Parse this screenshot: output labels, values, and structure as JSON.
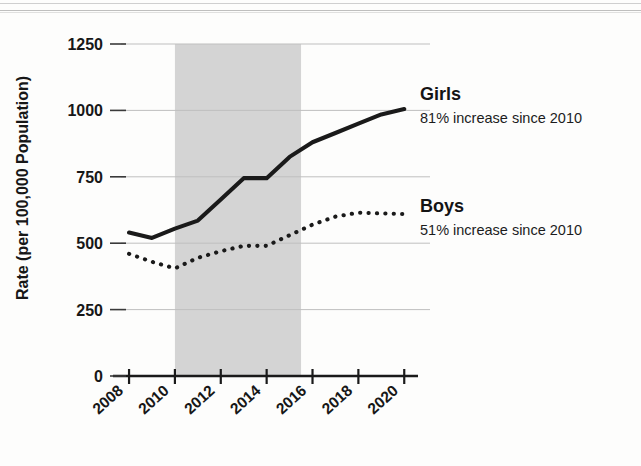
{
  "figure": {
    "background_color": "#fdfdfc",
    "scan_artifact": "horizontal-scan-lines-top"
  },
  "axes": {
    "y_axis_title": "Rate (per 100,000 Population)",
    "y_ticks": [
      "0",
      "250",
      "500",
      "750",
      "1000",
      "1250"
    ],
    "x_ticks": [
      "2008",
      "2010",
      "2012",
      "2014",
      "2016",
      "2018",
      "2020"
    ],
    "gridline_color": "#bfbfbf",
    "axis_color": "#1a1a1a"
  },
  "highlight_band": {
    "label": "shaded-period",
    "start_year": 2010,
    "end_year": 2015.5,
    "color": "#d4d4d4"
  },
  "legend": {
    "girls": {
      "name": "Girls",
      "note": "81% increase since 2010",
      "color": "#1a1a1a",
      "style": "solid"
    },
    "boys": {
      "name": "Boys",
      "note": "51% increase since 2010",
      "color": "#1a1a1a",
      "style": "dotted"
    }
  },
  "chart_data": {
    "type": "line",
    "title": "",
    "subtitle": "",
    "xlabel": "",
    "ylabel": "Rate (per 100,000 Population)",
    "x": [
      2008,
      2009,
      2010,
      2011,
      2012,
      2013,
      2014,
      2015,
      2016,
      2017,
      2018,
      2019,
      2020
    ],
    "xlim": [
      2007.3,
      2020.6
    ],
    "ylim": [
      0,
      1250
    ],
    "xticks": [
      2008,
      2010,
      2012,
      2014,
      2016,
      2018,
      2020
    ],
    "yticks": [
      0,
      250,
      500,
      750,
      1000,
      1250
    ],
    "grid": "horizontal",
    "legend_position": "right-inline",
    "annotations": [
      {
        "text": "81% increase since 2010",
        "series": "Girls"
      },
      {
        "text": "51% increase since 2010",
        "series": "Boys"
      }
    ],
    "shaded_region": {
      "x0": 2010,
      "x1": 2015.5,
      "color": "#d4d4d4"
    },
    "series": [
      {
        "name": "Girls",
        "style": "solid",
        "color": "#1a1a1a",
        "values": [
          540,
          520,
          555,
          585,
          665,
          745,
          745,
          825,
          880,
          915,
          950,
          985,
          1005
        ]
      },
      {
        "name": "Boys",
        "style": "dotted",
        "color": "#1a1a1a",
        "values": [
          460,
          430,
          405,
          445,
          470,
          490,
          490,
          530,
          570,
          600,
          615,
          612,
          610
        ]
      }
    ]
  }
}
